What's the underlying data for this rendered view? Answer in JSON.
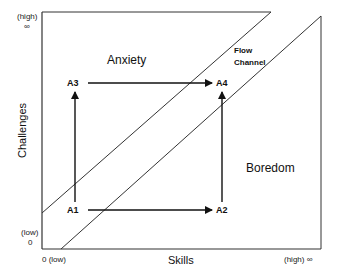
{
  "diagram": {
    "type": "flow-channel-model",
    "axes": {
      "x": {
        "title": "Skills",
        "low_label": "0 (low)",
        "high_label": "(high) ∞"
      },
      "y": {
        "title": "Challenges",
        "low_label_top": "(low)",
        "low_label_bottom": "0",
        "high_label_top": "(high)",
        "high_label_bottom": "∞"
      }
    },
    "regions": {
      "anxiety": "Anxiety",
      "boredom": "Boredom",
      "flow_line1": "Flow",
      "flow_line2": "Channel"
    },
    "nodes": [
      {
        "id": "A1",
        "label": "A1"
      },
      {
        "id": "A2",
        "label": "A2"
      },
      {
        "id": "A3",
        "label": "A3"
      },
      {
        "id": "A4",
        "label": "A4"
      }
    ],
    "edges": [
      {
        "from": "A1",
        "to": "A2"
      },
      {
        "from": "A1",
        "to": "A3"
      },
      {
        "from": "A3",
        "to": "A4"
      },
      {
        "from": "A2",
        "to": "A4"
      }
    ],
    "colors": {
      "line": "#222222",
      "background": "#ffffff"
    }
  }
}
